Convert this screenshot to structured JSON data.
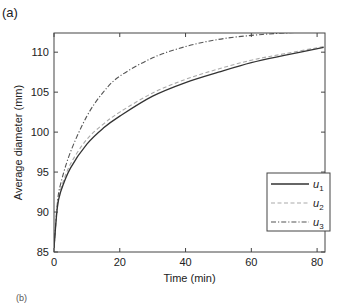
{
  "panel_label": "(a)",
  "next_panel_label": "(b)",
  "chart_data": {
    "type": "line",
    "title": "",
    "xlabel": "Time (min)",
    "ylabel": "Average diameter (mm)",
    "xlim": [
      0,
      82.4
    ],
    "ylim": [
      85,
      112.4
    ],
    "xticks": [
      0,
      20,
      40,
      60,
      80
    ],
    "yticks": [
      85,
      90,
      95,
      100,
      105,
      110
    ],
    "grid": false,
    "legend_position": "lower right",
    "series": [
      {
        "name": "u1",
        "label_base": "u",
        "label_sub": "1",
        "style": "solid",
        "color": "#333333",
        "x": [
          0,
          1,
          2,
          5,
          10,
          15,
          20,
          30,
          40,
          50,
          60,
          70,
          82
        ],
        "values": [
          85.5,
          90.5,
          92.5,
          95.5,
          98.5,
          100.5,
          102.0,
          104.5,
          106.2,
          107.5,
          108.7,
          109.6,
          110.6
        ]
      },
      {
        "name": "u2",
        "label_base": "u",
        "label_sub": "2",
        "style": "dashed",
        "color": "#aaaaaa",
        "x": [
          0,
          1,
          2,
          5,
          10,
          15,
          20,
          30,
          40,
          50,
          60,
          70,
          82
        ],
        "values": [
          85.5,
          90.7,
          92.8,
          96.0,
          99.1,
          101.0,
          102.5,
          104.9,
          106.6,
          107.9,
          109.0,
          109.8,
          110.7
        ]
      },
      {
        "name": "u3",
        "label_base": "u",
        "label_sub": "3",
        "style": "dashdot",
        "color": "#555555",
        "x": [
          0,
          1,
          2,
          5,
          10,
          15,
          20,
          30,
          40,
          50,
          60,
          70,
          82
        ],
        "values": [
          85.5,
          91.0,
          93.5,
          97.5,
          102.0,
          105.0,
          107.0,
          109.3,
          110.7,
          111.6,
          112.1,
          112.4,
          112.6
        ]
      }
    ]
  }
}
